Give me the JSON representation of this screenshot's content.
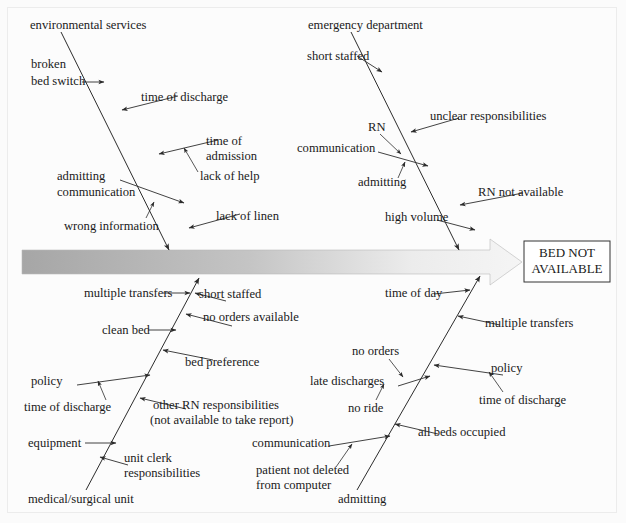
{
  "diagram": {
    "type": "fishbone",
    "title": "",
    "effect": {
      "line1": "BED NOT",
      "line2": "AVAILABLE"
    },
    "spine": {
      "gradient_from": "#a8a8a8",
      "gradient_to": "#f2f2f2",
      "outline": "#b9b9b9"
    },
    "bones": [
      {
        "id": "upper-left",
        "position": "top-left",
        "head_label": "environmental services",
        "causes": [
          {
            "label": "broken\nbed switch",
            "side": "left"
          },
          {
            "label": "time of discharge",
            "side": "right"
          },
          {
            "label": "time of\nadmission",
            "side": "right"
          },
          {
            "label": "lack of help",
            "side": "right",
            "sub_of": "time of admission"
          },
          {
            "label": "admitting\ncommunication",
            "side": "left"
          },
          {
            "label": "wrong information",
            "side": "left",
            "sub_of": "admitting communication"
          },
          {
            "label": "lack of linen",
            "side": "right"
          }
        ]
      },
      {
        "id": "upper-right",
        "position": "top-right",
        "head_label": "emergency department",
        "causes": [
          {
            "label": "short staffed",
            "side": "left"
          },
          {
            "label": "unclear responsibilities",
            "side": "right"
          },
          {
            "label": "RN",
            "side": "left"
          },
          {
            "label": "communication",
            "side": "left"
          },
          {
            "label": "admitting",
            "side": "left",
            "sub_of": "communication"
          },
          {
            "label": "RN not available",
            "side": "right"
          },
          {
            "label": "high volume",
            "side": "left"
          }
        ]
      },
      {
        "id": "lower-left",
        "position": "bottom-left",
        "head_label": "medical/surgical unit",
        "causes": [
          {
            "label": "multiple transfers",
            "side": "left"
          },
          {
            "label": "short staffed",
            "side": "right"
          },
          {
            "label": "no orders available",
            "side": "right"
          },
          {
            "label": "clean bed",
            "side": "left"
          },
          {
            "label": "bed preference",
            "side": "right"
          },
          {
            "label": "policy",
            "side": "left"
          },
          {
            "label": "time of discharge",
            "side": "left",
            "sub_of": "policy"
          },
          {
            "label": "other RN responsibilities\n(not available to take report)",
            "side": "right"
          },
          {
            "label": "equipment",
            "side": "left"
          },
          {
            "label": "unit clerk\nresponsibilities",
            "side": "right"
          }
        ]
      },
      {
        "id": "lower-right",
        "position": "bottom-right",
        "head_label": "admitting",
        "causes": [
          {
            "label": "time of day",
            "side": "left"
          },
          {
            "label": "multiple transfers",
            "side": "right"
          },
          {
            "label": "policy",
            "side": "right"
          },
          {
            "label": "time of discharge",
            "side": "right",
            "sub_of": "policy"
          },
          {
            "label": "no orders",
            "side": "left"
          },
          {
            "label": "late discharges",
            "side": "left"
          },
          {
            "label": "no ride",
            "side": "left",
            "sub_of": "late discharges"
          },
          {
            "label": "all beds occupied",
            "side": "right"
          },
          {
            "label": "communication",
            "side": "left"
          },
          {
            "label": "patient not deleted\nfrom computer",
            "side": "left",
            "sub_of": "communication"
          }
        ]
      }
    ],
    "labels": {
      "environmental_services": "environmental services",
      "broken": "broken",
      "bed_switch": "bed switch",
      "time_of_discharge_ul": "time of discharge",
      "time_of": "time of",
      "admission": "admission",
      "lack_of_help": "lack of help",
      "admitting_ul": "admitting",
      "communication_ul": "communication",
      "wrong_information": "wrong information",
      "lack_of_linen": "lack of linen",
      "emergency_department": "emergency department",
      "short_staffed_ur": "short staffed",
      "rn": "RN",
      "unclear_responsibilities": "unclear responsibilities",
      "communication_ur": "communication",
      "admitting_ur": "admitting",
      "rn_not_available": "RN not available",
      "high_volume": "high volume",
      "multiple_transfers_ll": "multiple transfers",
      "short_staffed_ll": "short staffed",
      "no_orders_available": "no orders available",
      "clean_bed": "clean bed",
      "bed_preference": "bed preference",
      "policy_ll": "policy",
      "time_of_discharge_ll": "time of discharge",
      "other_rn_responsibilities": "other RN responsibilities",
      "not_available_to_take_report": "(not available to take report)",
      "equipment": "equipment",
      "unit_clerk": "unit clerk",
      "responsibilities": "responsibilities",
      "medical_surgical_unit": "medical/surgical unit",
      "time_of_day": "time of day",
      "multiple_transfers_lr": "multiple transfers",
      "no_orders": "no orders",
      "policy_lr": "policy",
      "late_discharges": "late discharges",
      "time_of_discharge_lr": "time of discharge",
      "no_ride": "no ride",
      "all_beds_occupied": "all beds occupied",
      "communication_lr": "communication",
      "patient_not_deleted": "patient not deleted",
      "from_computer": "from computer",
      "admitting_lr": "admitting"
    }
  }
}
